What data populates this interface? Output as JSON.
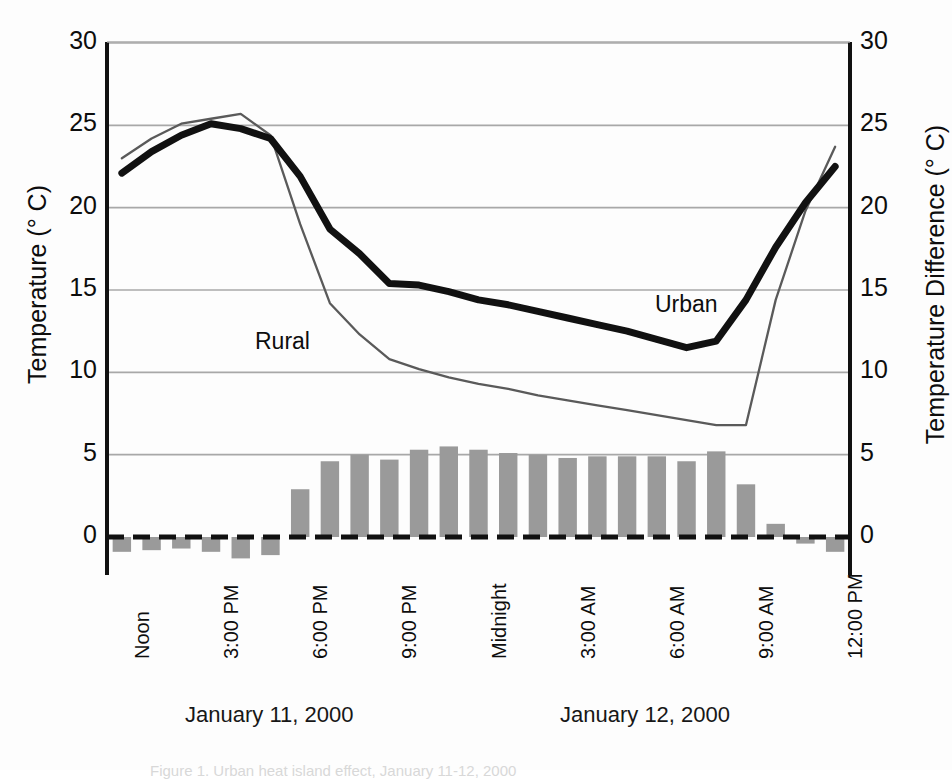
{
  "axes": {
    "left_title": "Temperature (° C)",
    "right_title": "Temperature Difference (° C)",
    "y_ticks": [
      "0",
      "5",
      "10",
      "15",
      "20",
      "25",
      "30"
    ],
    "y_ticks_right": [
      "0",
      "5",
      "10",
      "15",
      "20",
      "25",
      "30"
    ],
    "x_ticks": [
      "Noon",
      "3:00 PM",
      "6:00 PM",
      "9:00 PM",
      "Midnight",
      "3:00 AM",
      "6:00 AM",
      "9:00 AM",
      "12:00 PM"
    ]
  },
  "date_labels": [
    {
      "text": "January 11, 2000"
    },
    {
      "text": "January 12, 2000"
    }
  ],
  "series_labels": [
    {
      "text": "Rural"
    },
    {
      "text": "Urban"
    }
  ],
  "caption": "Figure 1. Urban heat island effect, January 11-12, 2000",
  "colors": {
    "urban_line": "#111111",
    "rural_line": "#5a5a5a",
    "bar_fill": "#9a9a9a",
    "gridline": "#a8a8a8",
    "axis": "#111111",
    "zero_line": "#111111"
  },
  "chart_data": {
    "type": "line",
    "title": "",
    "xlabel": "",
    "ylabel": "Temperature (° C)",
    "ylabel_right": "Temperature Difference (° C)",
    "ylim": [
      0,
      30
    ],
    "ylim_right": [
      0,
      30
    ],
    "grid": true,
    "legend_position": "inline-annotations",
    "x": [
      "Noon",
      "1:00 PM",
      "2:00 PM",
      "3:00 PM",
      "4:00 PM",
      "5:00 PM",
      "6:00 PM",
      "7:00 PM",
      "8:00 PM",
      "9:00 PM",
      "10:00 PM",
      "11:00 PM",
      "Midnight",
      "1:00 AM",
      "2:00 AM",
      "3:00 AM",
      "4:00 AM",
      "5:00 AM",
      "6:00 AM",
      "7:00 AM",
      "8:00 AM",
      "9:00 AM",
      "10:00 AM",
      "11:00 AM",
      "12:00 PM"
    ],
    "series": [
      {
        "name": "Urban",
        "type": "line",
        "axis": "left",
        "values": [
          22.1,
          23.4,
          24.4,
          25.1,
          24.8,
          24.2,
          21.9,
          18.7,
          17.2,
          15.4,
          15.3,
          14.9,
          14.4,
          14.1,
          13.7,
          13.3,
          12.9,
          12.5,
          12.0,
          11.5,
          11.9,
          14.4,
          17.6,
          20.3,
          22.5
        ]
      },
      {
        "name": "Rural",
        "type": "line",
        "axis": "left",
        "values": [
          23.0,
          24.2,
          25.1,
          25.4,
          25.7,
          24.4,
          19.0,
          14.2,
          12.3,
          10.8,
          10.2,
          9.7,
          9.3,
          9.0,
          8.6,
          8.3,
          8.0,
          7.7,
          7.4,
          7.1,
          6.8,
          6.8,
          14.4,
          19.8,
          23.7
        ]
      },
      {
        "name": "Temperature Difference",
        "type": "bar",
        "axis": "right",
        "values": [
          -0.9,
          -0.8,
          -0.7,
          -0.9,
          -1.3,
          -1.1,
          2.9,
          4.6,
          5.0,
          4.7,
          5.3,
          5.5,
          5.3,
          5.1,
          5.0,
          4.8,
          4.9,
          4.9,
          4.9,
          4.6,
          5.2,
          3.2,
          0.8,
          -0.4,
          -0.9
        ]
      }
    ]
  },
  "geometry": {
    "plot_left": 107,
    "plot_right": 850,
    "y_top_px": 43,
    "y_zero_px": 537,
    "x_tick_indices": [
      0,
      3,
      6,
      9,
      12,
      15,
      18,
      21,
      24
    ]
  }
}
